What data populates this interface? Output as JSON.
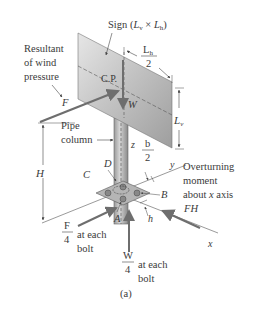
{
  "figure": {
    "caption": "(a)",
    "sign_label": "Sign (",
    "sign_dims": {
      "lv": "L",
      "lv_sub": "v",
      "times": " × ",
      "lh": "L",
      "lh_sub": "h",
      "close": ")"
    },
    "cp_label": "C.P.",
    "weight_label": "W",
    "wind_label": {
      "line1": "Resultant",
      "line2": "of wind",
      "line3": "pressure"
    },
    "force_label": "F",
    "lh_half": {
      "num": "L",
      "num_sub": "h",
      "den": "2"
    },
    "lv_label": {
      "main": "L",
      "sub": "v"
    },
    "pipe_label": {
      "line1": "Pipe",
      "line2": "column"
    },
    "z_axis": "z",
    "y_axis": "y",
    "x_axis": "x",
    "b_half": {
      "num": "b",
      "den": "2"
    },
    "height_label": "H",
    "points": {
      "A": "A",
      "B": "B",
      "C": "C",
      "D": "D"
    },
    "h_label": "h",
    "moment_label": {
      "line1": "Overturning",
      "line2": "moment",
      "line3": "about x axis",
      "line3_a": "about ",
      "line3_x": "x",
      "line3_b": " axis"
    },
    "fh_label": "FH",
    "f_bolt": {
      "num": "F",
      "den": "4",
      "line1": "at each",
      "line2": "bolt"
    },
    "w_bolt": {
      "num": "W",
      "den": "4",
      "line1": "at each",
      "line2": "bolt"
    }
  },
  "colors": {
    "sign_light": "#d9d9d9",
    "sign_dark": "#a9a9a9",
    "arrow": "#6e6e6e",
    "line": "#4a4a4a",
    "text": "#3a3a3a"
  }
}
